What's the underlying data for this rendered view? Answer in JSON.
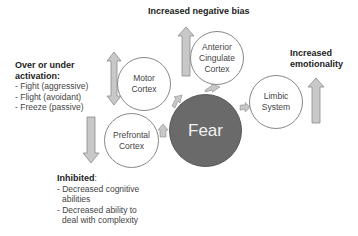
{
  "diagram": {
    "title_top": "Increased negative bias",
    "center": {
      "label": "Fear",
      "color": "#6a6a6a"
    },
    "nodes": {
      "acc": {
        "lines": [
          "Anterior",
          "Cingulate",
          "Cortex"
        ]
      },
      "motor": {
        "lines": [
          "Motor",
          "Cortex"
        ]
      },
      "prefrontal": {
        "lines": [
          "Prefrontal",
          "Cortex"
        ]
      },
      "limbic": {
        "lines": [
          "Limbic",
          "System"
        ]
      }
    },
    "right_label": {
      "lines": [
        "Increased",
        "emotionality"
      ]
    },
    "left_block": {
      "heading_lines": [
        "Over or under",
        "activation:"
      ],
      "items": [
        "- Fight (aggressive)",
        "- Flight (avoidant)",
        "- Freeze (passive)"
      ]
    },
    "bottom_block": {
      "heading": "Inhibited",
      "heading_suffix": ":",
      "items": [
        {
          "first": "- Decreased cognitive",
          "cont": "abilities"
        },
        {
          "first": "- Decreased ability to",
          "cont": "deal with complexity"
        }
      ]
    },
    "arrows": [
      {
        "name": "acc-up-arrow",
        "direction": "up"
      },
      {
        "name": "motor-double-arrow",
        "direction": "up-down"
      },
      {
        "name": "prefrontal-down-arrow",
        "direction": "down"
      },
      {
        "name": "limbic-up-arrow",
        "direction": "up"
      }
    ],
    "colors": {
      "arrow_fill": "#c8c8c8",
      "arrow_stroke": "#8a8a8a",
      "circle_border": "#888888"
    }
  }
}
